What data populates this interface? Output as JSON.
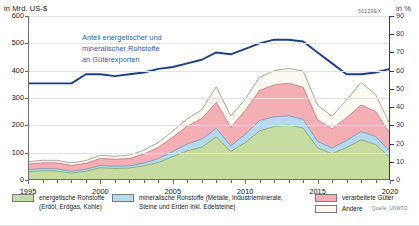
{
  "header": {
    "left_axis_unit": "in Mrd. US-$",
    "right_axis_unit": "in %",
    "graphic_code": "50229EX"
  },
  "annotation": {
    "line1": "Anteil energetischer und",
    "line2": "mineralischer Rohstoffe",
    "line3": "an Güterexporten",
    "color": "#2c5fb5"
  },
  "legend": {
    "items": [
      {
        "name": "energetische-rohstoffe",
        "label_line1": "energetische Rohstoffe",
        "label_line2": "(Erdöl, Erdgas, Kohle)",
        "color": "#c6dca0"
      },
      {
        "name": "mineralische-rohstoffe",
        "label_line1": "mineralische Rohstoffe (Metalle, Industrieminerale,",
        "label_line2": "Steine und Erden inkl. Edelsteine)",
        "color": "#b7d9f0"
      },
      {
        "name": "verarbeitete-gueter",
        "label_line1": "verarbeitete Güter",
        "label_line2": "",
        "color": "#f4afb4"
      },
      {
        "name": "andere",
        "label_line1": "Andere",
        "label_line2": "",
        "color": "#fdfaf2"
      }
    ],
    "source": "Quelle: UNWTO"
  },
  "chart_data": {
    "type": "area",
    "title": "",
    "subtitle": "",
    "xlabel": "",
    "ylabel": "in Mrd. US-$",
    "y2label": "in %",
    "xlim": [
      1995,
      2020
    ],
    "ylim": [
      0,
      600
    ],
    "y2lim": [
      0,
      90
    ],
    "grid": true,
    "legend_position": "bottom",
    "x": [
      1995,
      1996,
      1997,
      1998,
      1999,
      2000,
      2001,
      2002,
      2003,
      2004,
      2005,
      2006,
      2007,
      2008,
      2009,
      2010,
      2011,
      2012,
      2013,
      2014,
      2015,
      2016,
      2017,
      2018,
      2019,
      2020
    ],
    "xticks_major": [
      1995,
      2000,
      2005,
      2010,
      2015,
      2020
    ],
    "xtick_labels": [
      "1995",
      "2000",
      "2005",
      "2010",
      "2015",
      "2020"
    ],
    "yticks_left": [
      0,
      100,
      200,
      300,
      400,
      500,
      600
    ],
    "ytick_labels_left": [
      "0",
      "100",
      "200",
      "300",
      "400",
      "500",
      "600"
    ],
    "yticks_right": [
      0,
      10,
      20,
      30,
      40,
      50,
      60,
      70,
      80,
      90
    ],
    "ytick_labels_right": [
      "0",
      "10",
      "20",
      "30",
      "40",
      "50",
      "60",
      "70",
      "80",
      "90"
    ],
    "stacked_series": [
      {
        "name": "energetische Rohstoffe (Erdöl, Erdgas, Kohle)",
        "color": "#c6dca0",
        "edge": "#7c9b52",
        "values": [
          30,
          34,
          33,
          25,
          32,
          45,
          42,
          44,
          52,
          64,
          86,
          107,
          120,
          158,
          104,
          137,
          180,
          196,
          201,
          190,
          118,
          96,
          119,
          147,
          130,
          82
        ]
      },
      {
        "name": "mineralische Rohstoffe (Metalle, Industrieminerale, Steine und Erden inkl. Edelsteine)",
        "color": "#b7d9f0",
        "edge": "#5c90bd",
        "values": [
          8,
          8,
          8,
          7,
          7,
          8,
          8,
          8,
          10,
          14,
          18,
          25,
          29,
          31,
          21,
          30,
          38,
          35,
          34,
          32,
          23,
          21,
          26,
          30,
          29,
          23
        ]
      },
      {
        "name": "verarbeitete Güter",
        "color": "#f4afb4",
        "edge": "#c4626b",
        "values": [
          20,
          21,
          22,
          21,
          22,
          26,
          26,
          27,
          33,
          41,
          53,
          65,
          76,
          95,
          67,
          87,
          110,
          117,
          119,
          117,
          79,
          70,
          83,
          97,
          92,
          63
        ]
      },
      {
        "name": "Andere",
        "color": "#fdfaf2",
        "edge": "#8a8277",
        "values": [
          9,
          9,
          9,
          10,
          10,
          11,
          11,
          12,
          14,
          18,
          22,
          27,
          32,
          57,
          42,
          42,
          48,
          52,
          54,
          60,
          53,
          46,
          65,
          83,
          62,
          35
        ]
      }
    ],
    "line_series": {
      "name": "Anteil energetischer und mineralischer Rohstoffe an Güterexporten",
      "color": "#1b3f8f",
      "axis": "right",
      "unit": "%",
      "values": [
        53,
        53,
        53,
        53,
        58,
        58,
        57,
        58,
        59,
        61,
        62,
        64,
        66,
        70,
        69,
        72,
        75,
        77,
        77,
        76,
        70,
        64,
        58,
        58,
        59,
        61,
        62
      ]
    }
  }
}
